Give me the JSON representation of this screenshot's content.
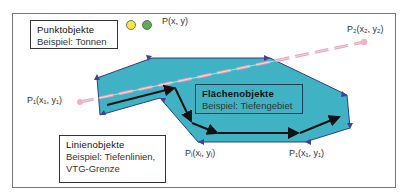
{
  "diagram": {
    "colors": {
      "area_fill": "#3fb3c4",
      "area_edge": "#2b3f8a",
      "vertex_marker": "#4b3b9a",
      "line": "#111111",
      "dashed_line": "#e6a0b4",
      "point_yellow": "#f2ea3a",
      "point_green": "#5cae4e",
      "frame": "#777777"
    },
    "point_objects": {
      "title": "Punktobjekte",
      "example": "Beispiel: Tonnen",
      "point_label": "P(x, y)"
    },
    "area_objects": {
      "title": "Flächenobjekte",
      "example": "Beispiel: Tiefengebiet"
    },
    "line_objects": {
      "title": "Linienobjekte",
      "example_line1": "Beispiel: Tiefenlinien,",
      "example_line2": "VTG-Grenze"
    },
    "point_labels": {
      "p1_left": "P₁(x₁, y₁)",
      "p2_right": "P₂(x₂, y₂)",
      "pi_bottom": "Pᵢ(xᵢ, yᵢ)",
      "p1_bottom": "P₁(x₁, y₁)"
    }
  }
}
